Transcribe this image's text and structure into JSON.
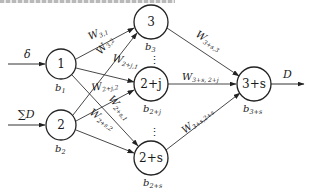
{
  "diagram": {
    "type": "neural-network",
    "inputs": [
      {
        "id": "in1",
        "label": "δ",
        "target": "1"
      },
      {
        "id": "in2",
        "label": "∑D",
        "target": "2"
      }
    ],
    "output": {
      "label": "D",
      "source": "3+s"
    },
    "nodes": [
      {
        "id": "1",
        "label": "1",
        "bias": "b",
        "bias_sub": "1"
      },
      {
        "id": "2",
        "label": "2",
        "bias": "b",
        "bias_sub": "2"
      },
      {
        "id": "3",
        "label": "3",
        "bias": "b",
        "bias_sub": "3"
      },
      {
        "id": "2+j",
        "label": "2+j",
        "bias": "b",
        "bias_sub": "2+j"
      },
      {
        "id": "2+s",
        "label": "2+s",
        "bias": "b",
        "bias_sub": "2+s"
      },
      {
        "id": "3+s",
        "label": "3+s",
        "bias": "b",
        "bias_sub": "3+s"
      }
    ],
    "edges": [
      {
        "from": "1",
        "to": "3",
        "weight": "W",
        "sub": "3,1"
      },
      {
        "from": "2",
        "to": "3",
        "weight": "W",
        "sub": "3,2"
      },
      {
        "from": "1",
        "to": "2+j",
        "weight": "W",
        "sub": "2+j,1"
      },
      {
        "from": "2",
        "to": "2+j",
        "weight": "W",
        "sub": "2+j,2"
      },
      {
        "from": "1",
        "to": "2+s",
        "weight": "W",
        "sub": "2+s,1"
      },
      {
        "from": "2",
        "to": "2+s",
        "weight": "W",
        "sub": "2+s,2"
      },
      {
        "from": "3",
        "to": "3+s",
        "weight": "W",
        "sub": "3+s,3"
      },
      {
        "from": "2+j",
        "to": "3+s",
        "weight": "W",
        "sub": "3+s, 2+j"
      },
      {
        "from": "2+s",
        "to": "3+s",
        "weight": "W",
        "sub": "3+s,2+s"
      }
    ],
    "ellipsis": "⋮"
  }
}
